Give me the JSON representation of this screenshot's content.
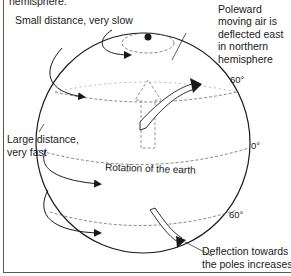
{
  "labels": {
    "top_cut": "hemisphere.",
    "small_distance": "Small distance, very slow",
    "poleward": [
      "Poleward",
      "moving air is",
      "deflected east",
      "in northern",
      "hemisphere"
    ],
    "large_distance": [
      "Large distance,",
      "very fast"
    ],
    "rotation": "Rotation of the earth",
    "deflection": [
      "Deflection towards",
      "the poles increases."
    ]
  },
  "latitudes": {
    "north": "60°",
    "equator": "0°",
    "south": "60°"
  },
  "colors": {
    "line": "#1a1a1a",
    "dashed": "#777777",
    "background": "#ffffff"
  }
}
